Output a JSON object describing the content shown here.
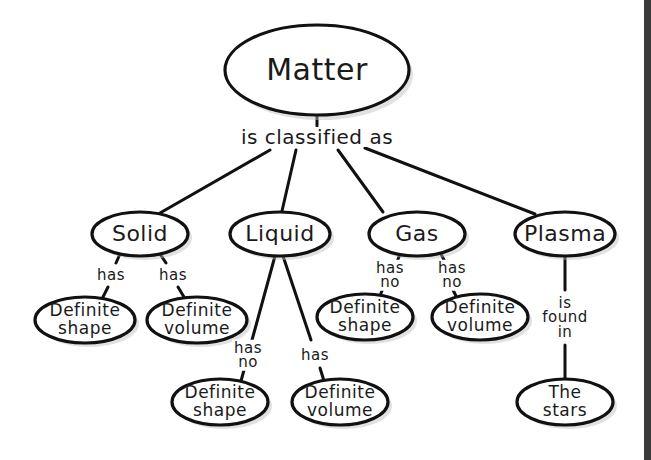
{
  "diagram": {
    "title": "Matter",
    "root": {
      "label": "Matter",
      "link": "is classified as"
    },
    "states": [
      {
        "label": "Solid",
        "children": [
          {
            "link": [
              "has"
            ],
            "label": [
              "Definite",
              "shape"
            ]
          },
          {
            "link": [
              "has"
            ],
            "label": [
              "Definite",
              "volume"
            ]
          }
        ]
      },
      {
        "label": "Liquid",
        "children": [
          {
            "link": [
              "has",
              "no"
            ],
            "label": [
              "Definite",
              "shape"
            ]
          },
          {
            "link": [
              "has"
            ],
            "label": [
              "Definite",
              "volume"
            ]
          }
        ]
      },
      {
        "label": "Gas",
        "children": [
          {
            "link": [
              "has",
              "no"
            ],
            "label": [
              "Definite",
              "shape"
            ]
          },
          {
            "link": [
              "has",
              "no"
            ],
            "label": [
              "Definite",
              "volume"
            ]
          }
        ]
      },
      {
        "label": "Plasma",
        "children": [
          {
            "link": [
              "is",
              "found",
              "in"
            ],
            "label": [
              "The",
              "stars"
            ]
          }
        ]
      }
    ]
  },
  "colors": {
    "line": "#111111",
    "background": "#ffffff",
    "right_bar": "#3a3a3a"
  }
}
